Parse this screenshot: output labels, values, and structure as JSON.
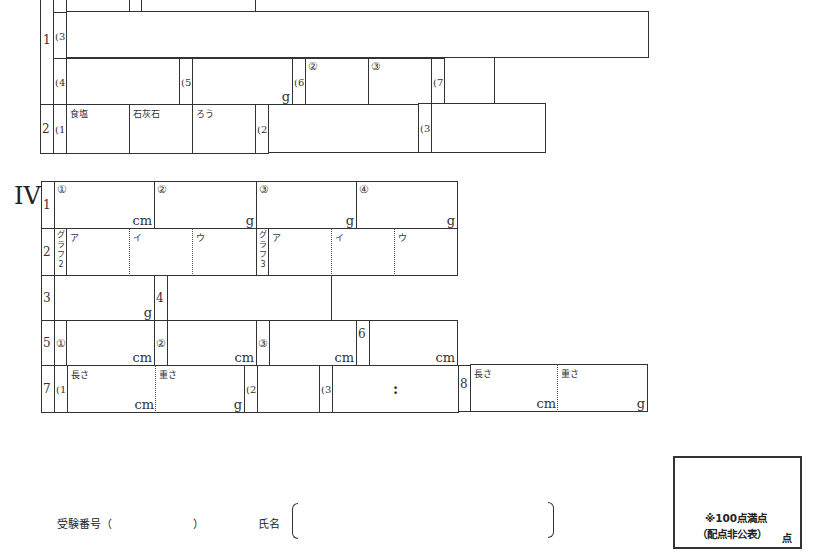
{
  "section3": {
    "q1": {
      "number": "1",
      "sub3": "(3)",
      "sub4": "(4)",
      "sub5": "(5)",
      "sub6": "(6)",
      "sub6_circles": [
        "②",
        "③"
      ],
      "sub7": "(7)",
      "unit_g": "g"
    },
    "q2": {
      "number": "2",
      "sub1": "(1)",
      "sub1_cells": [
        "食塩",
        "石灰石",
        "ろう"
      ],
      "sub2": "(2)",
      "sub3": "(3)"
    }
  },
  "section4": {
    "roman": "IV",
    "q1": {
      "number": "1",
      "cells": [
        {
          "circle": "①",
          "unit": "cm"
        },
        {
          "circle": "②",
          "unit": "g"
        },
        {
          "circle": "③",
          "unit": "g"
        },
        {
          "circle": "④",
          "unit": "g"
        }
      ]
    },
    "q2": {
      "number": "2",
      "graph2_label": [
        "グ",
        "ラ",
        "フ",
        "2"
      ],
      "graph3_label": [
        "グ",
        "ラ",
        "フ",
        "3"
      ],
      "graph2_cells": [
        "ア",
        "イ",
        "ウ"
      ],
      "graph3_cells": [
        "ア",
        "イ",
        "ウ"
      ]
    },
    "q3": {
      "number": "3",
      "unit": "g"
    },
    "q4": {
      "number": "4"
    },
    "q5": {
      "number": "5",
      "cells": [
        {
          "circle": "①",
          "unit": "cm"
        },
        {
          "circle": "②",
          "unit": "cm"
        },
        {
          "circle": "③",
          "unit": "cm"
        }
      ]
    },
    "q6": {
      "number": "6",
      "unit": "cm"
    },
    "q7": {
      "number": "7",
      "sub1": "(1)",
      "length_label": "長さ",
      "length_unit": "cm",
      "weight_label": "重さ",
      "weight_unit": "g",
      "sub2": "(2)",
      "sub3": "(3)",
      "ratio_sep": ":"
    },
    "q8": {
      "number": "8",
      "length_label": "長さ",
      "length_unit": "cm",
      "weight_label": "重さ",
      "weight_unit": "g"
    }
  },
  "footer": {
    "exam_number_label": "受験番号（",
    "exam_number_close": "）",
    "name_label": "氏名",
    "score_note_line1": "※100点満点",
    "score_note_line2": "（配点非公表）",
    "score_unit": "点"
  }
}
